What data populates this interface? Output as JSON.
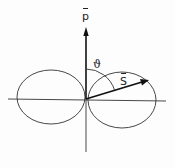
{
  "diagram": {
    "type": "radiation-pattern",
    "labels": {
      "p_vector": "p",
      "s_vector": "S",
      "angle": "ϑ"
    },
    "colors": {
      "stroke": "#222222",
      "background": "#fdfdfd"
    }
  }
}
